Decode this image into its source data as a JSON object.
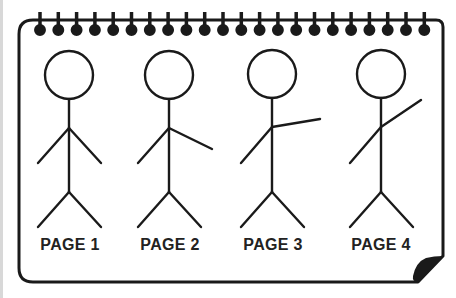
{
  "illustration": {
    "title": "Stick figure flipbook pages",
    "stroke_color": "#1a1a1a",
    "background": "#ffffff",
    "ring_count": 22,
    "pages": [
      {
        "label": "PAGE 1",
        "pose": "arms-down"
      },
      {
        "label": "PAGE 2",
        "pose": "right-arm-lowered-out"
      },
      {
        "label": "PAGE 3",
        "pose": "right-arm-horizontal"
      },
      {
        "label": "PAGE 4",
        "pose": "right-arm-raised"
      }
    ]
  }
}
